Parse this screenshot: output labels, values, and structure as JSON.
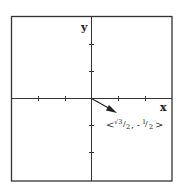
{
  "diagram": {
    "type": "vector-on-coordinate-plane",
    "axes": {
      "x_label": "x",
      "y_label": "y"
    },
    "x_ticks": [
      -2,
      -1,
      1,
      2
    ],
    "y_ticks": [
      -2,
      -1,
      1,
      2
    ],
    "vector": {
      "components": [
        "√3/2",
        "-1/2"
      ],
      "label_left": "<",
      "label_num1": "√3",
      "label_den1": "2",
      "label_sep": ", -",
      "label_num2": "1",
      "label_den2": "2",
      "label_right": ">"
    },
    "colors": {
      "ink": "#222222",
      "frame": "#333333"
    }
  }
}
